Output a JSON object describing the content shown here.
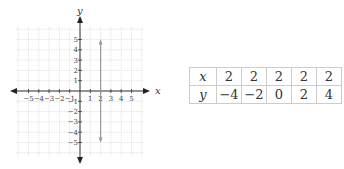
{
  "chart_data": {
    "type": "line",
    "title": "",
    "xlabel": "x",
    "ylabel": "y",
    "xlim": [
      -5,
      5
    ],
    "ylim": [
      -5,
      5
    ],
    "grid": true,
    "x_ticks": [
      -5,
      -4,
      -3,
      -2,
      -1,
      1,
      2,
      3,
      4,
      5
    ],
    "y_ticks": [
      -5,
      -4,
      -3,
      -2,
      -1,
      1,
      2,
      3,
      4,
      5
    ],
    "series": [
      {
        "name": "x = 2",
        "x": [
          2,
          2
        ],
        "y": [
          -5,
          5
        ],
        "style": "vertical line with arrows",
        "color": "#999999"
      }
    ]
  },
  "table": {
    "rows": [
      {
        "label": "x",
        "values": [
          "2",
          "2",
          "2",
          "2",
          "2"
        ]
      },
      {
        "label": "y",
        "values": [
          "−4",
          "−2",
          "0",
          "2",
          "4"
        ]
      }
    ]
  },
  "axes": {
    "x_label": "x",
    "y_label": "y"
  }
}
